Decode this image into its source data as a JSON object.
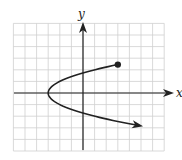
{
  "figure": {
    "type": "coordinate-graph",
    "axis_labels": {
      "x": "x",
      "y": "y"
    },
    "grid": {
      "visible": true,
      "unit_px": 11.6,
      "x_range": [
        -6,
        7
      ],
      "y_range": [
        -5,
        6
      ],
      "color": "#cfcfcf"
    },
    "origin_px": [
      83,
      93
    ],
    "curve": {
      "description": "sideways parabola opening right, vertex at (-3, 0)",
      "equation": "x = y^2 - 3",
      "vertex": [
        -3,
        0
      ],
      "start_point": {
        "x": 3,
        "y": 2.45,
        "marker": "closed-dot"
      },
      "end": {
        "x": 5.3,
        "y": -2.8,
        "marker": "arrow"
      },
      "color": "#222222"
    }
  }
}
